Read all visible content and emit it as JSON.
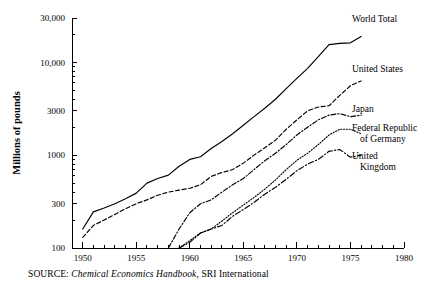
{
  "chart_data": {
    "type": "line",
    "title": "",
    "xlabel": "",
    "ylabel": "Millions of pounds",
    "yscale": "log",
    "ylim": [
      100,
      30000
    ],
    "xlim": [
      1949,
      1980
    ],
    "grid": false,
    "legend_position": "right-inline-labels",
    "ytick_labels": [
      "30,000",
      "10,000",
      "3000",
      "1000",
      "300",
      "100"
    ],
    "ytick_values": [
      30000,
      10000,
      3000,
      1000,
      300,
      100
    ],
    "xtick_labels": [
      "1950",
      "1955",
      "1960",
      "1965",
      "1970",
      "1975",
      "1980"
    ],
    "xtick_values": [
      1950,
      1955,
      1960,
      1965,
      1970,
      1975,
      1980
    ],
    "minor_xticks": "annual",
    "series": [
      {
        "name": "World Total",
        "style": "solid",
        "x": [
          1950,
          1951,
          1952,
          1953,
          1954,
          1955,
          1956,
          1957,
          1958,
          1959,
          1960,
          1961,
          1962,
          1963,
          1964,
          1965,
          1966,
          1967,
          1968,
          1969,
          1970,
          1971,
          1972,
          1973,
          1974,
          1975,
          1976
        ],
        "values": [
          160,
          245,
          270,
          300,
          340,
          390,
          500,
          560,
          610,
          760,
          900,
          960,
          1180,
          1400,
          1700,
          2100,
          2600,
          3200,
          4000,
          5200,
          6700,
          8600,
          11500,
          15500,
          16000,
          16200,
          19000
        ]
      },
      {
        "name": "United States",
        "style": "dashed",
        "x": [
          1950,
          1951,
          1952,
          1953,
          1954,
          1955,
          1956,
          1957,
          1958,
          1959,
          1960,
          1961,
          1962,
          1963,
          1964,
          1965,
          1966,
          1967,
          1968,
          1969,
          1970,
          1971,
          1972,
          1973,
          1974,
          1975,
          1976
        ],
        "values": [
          130,
          175,
          200,
          230,
          265,
          300,
          330,
          370,
          400,
          420,
          440,
          480,
          590,
          650,
          700,
          820,
          1000,
          1200,
          1450,
          1900,
          2400,
          3000,
          3300,
          3400,
          4400,
          5600,
          6300
        ]
      },
      {
        "name": "Japan",
        "style": "dashdot",
        "x": [
          1958,
          1959,
          1960,
          1961,
          1962,
          1963,
          1964,
          1965,
          1966,
          1967,
          1968,
          1969,
          1970,
          1971,
          1972,
          1973,
          1974,
          1975,
          1976
        ],
        "values": [
          100,
          160,
          240,
          300,
          330,
          400,
          480,
          560,
          700,
          870,
          1050,
          1300,
          1650,
          2000,
          2400,
          2700,
          2800,
          2600,
          2700
        ]
      },
      {
        "name": "Federal Republic of Germany",
        "style": "dotted",
        "x": [
          1959,
          1960,
          1961,
          1962,
          1963,
          1964,
          1965,
          1966,
          1967,
          1968,
          1969,
          1970,
          1971,
          1972,
          1973,
          1974,
          1975,
          1976
        ],
        "values": [
          100,
          120,
          145,
          160,
          195,
          240,
          290,
          350,
          430,
          540,
          700,
          880,
          1050,
          1300,
          1650,
          1900,
          1900,
          1700
        ]
      },
      {
        "name": "United Kingdom",
        "style": "dashdot2",
        "x": [
          1959,
          1960,
          1961,
          1962,
          1963,
          1964,
          1965,
          1966,
          1967,
          1968,
          1969,
          1970,
          1971,
          1972,
          1973,
          1974,
          1975,
          1976
        ],
        "values": [
          100,
          115,
          145,
          160,
          175,
          220,
          260,
          310,
          380,
          450,
          550,
          680,
          800,
          900,
          1100,
          1150,
          950,
          1000
        ]
      }
    ],
    "annotations": [
      {
        "text": "World Total",
        "target_series": "World Total"
      },
      {
        "text": "United States",
        "target_series": "United States"
      },
      {
        "text": "Japan",
        "target_series": "Japan"
      },
      {
        "text": "Federal Republic",
        "target_series": "Federal Republic of Germany"
      },
      {
        "text": "of Germany",
        "target_series": "Federal Republic of Germany"
      },
      {
        "text": "United",
        "target_series": "United Kingdom"
      },
      {
        "text": "Kingdom",
        "target_series": "United Kingdom"
      }
    ]
  },
  "legend_labels": {
    "world_total": "World Total",
    "united_states": "United States",
    "japan": "Japan",
    "germany_line1": "Federal Republic",
    "germany_line2": "of Germany",
    "uk_line1": "United",
    "uk_line2": "Kingdom"
  },
  "axis": {
    "y_title": "Millions of pounds"
  },
  "source": {
    "label": "SOURCE:",
    "title": "Chemical Economics Handbook",
    "rest": ", SRI International"
  },
  "colors": {
    "ink": "#000000",
    "background": "#ffffff"
  }
}
